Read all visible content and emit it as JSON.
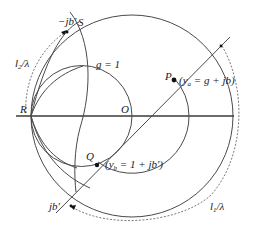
{
  "diagram": {
    "type": "smith_chart_single_stub_matching",
    "points": {
      "R": "R",
      "O": "O",
      "P": "P",
      "Q": "Q",
      "S": "S"
    },
    "labels": {
      "g_circle": "g = 1",
      "ya_eq": "(y",
      "ya_sub": "a",
      "ya_rest": " = g + jb)",
      "yb_eq": "(y",
      "yb_sub": "b",
      "yb_rest": " = 1 + jb′)",
      "minus_jb": "−jb′",
      "plus_jb": "jb′",
      "l2_main": "l",
      "l2_sub": "2",
      "l2_rest": "/λ",
      "l1_main": "l",
      "l1_sub": "1",
      "l1_rest": "/λ"
    },
    "colors": {
      "stroke": "#4a4a4a",
      "text": "#222222",
      "background": "#ffffff"
    }
  }
}
